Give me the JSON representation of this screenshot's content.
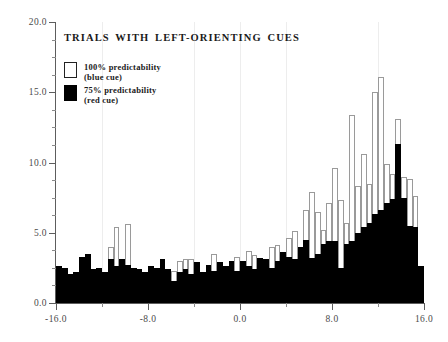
{
  "chart_data": {
    "type": "bar",
    "title": "TRIALS  WITH  LEFT-ORIENTING  CUES",
    "xlabel": "",
    "ylabel": "",
    "xlim": [
      -16.0,
      16.0
    ],
    "ylim": [
      0.0,
      20.0
    ],
    "grid": false,
    "bin_width": 0.5,
    "legend_position": "top-left",
    "x_ticks": [
      "-16.0",
      "-8.0",
      "0.0",
      "8.0",
      "16.0"
    ],
    "x_tick_values": [
      -16.0,
      -8.0,
      0.0,
      8.0,
      16.0
    ],
    "x_minor_tick_values": [
      -12.0,
      -4.0,
      4.0,
      12.0
    ],
    "y_ticks": [
      "0.0",
      "5.0",
      "10.0",
      "15.0",
      "20.0"
    ],
    "y_tick_values": [
      0.0,
      5.0,
      10.0,
      15.0,
      20.0
    ],
    "y_minor_tick_values": [
      1.25,
      2.5,
      3.75,
      6.25,
      7.5,
      8.75,
      11.25,
      12.5,
      13.75,
      16.25,
      17.5,
      18.75
    ],
    "bin_centers": [
      -15.75,
      -15.25,
      -14.75,
      -14.25,
      -13.75,
      -13.25,
      -12.75,
      -12.25,
      -11.75,
      -11.25,
      -10.75,
      -10.25,
      -9.75,
      -9.25,
      -8.75,
      -8.25,
      -7.75,
      -7.25,
      -6.75,
      -6.25,
      -5.75,
      -5.25,
      -4.75,
      -4.25,
      -3.75,
      -3.25,
      -2.75,
      -2.25,
      -1.75,
      -1.25,
      -0.75,
      -0.25,
      0.25,
      0.75,
      1.25,
      1.75,
      2.25,
      2.75,
      3.25,
      3.75,
      4.25,
      4.75,
      5.25,
      5.75,
      6.25,
      6.75,
      7.25,
      7.75,
      8.25,
      8.75,
      9.25,
      9.75,
      10.25,
      10.75,
      11.25,
      11.75,
      12.25,
      12.75,
      13.25,
      13.75,
      14.25,
      14.75,
      15.25,
      15.75
    ],
    "series": [
      {
        "name": "100% predictability (blue cue)",
        "style": "open-outline",
        "color": "#ffffff",
        "edge_color": "#9a9a9a",
        "values": [
          2.6,
          2.5,
          2.1,
          2.2,
          3.3,
          3.5,
          2.4,
          2.5,
          2.2,
          4.0,
          5.4,
          3.1,
          5.6,
          2.5,
          2.4,
          2.2,
          2.6,
          2.5,
          3.1,
          2.4,
          2.3,
          3.0,
          3.1,
          3.1,
          2.9,
          2.2,
          2.7,
          3.5,
          2.9,
          2.6,
          3.0,
          3.3,
          3.0,
          3.7,
          3.4,
          3.2,
          3.1,
          4.0,
          4.1,
          3.6,
          4.6,
          5.1,
          4.0,
          6.6,
          7.9,
          6.5,
          5.2,
          7.1,
          9.6,
          7.3,
          5.7,
          13.4,
          8.3,
          10.6,
          8.5,
          15.0,
          16.1,
          9.9,
          9.2,
          13.1,
          9.0,
          8.8,
          7.6,
          2.6
        ]
      },
      {
        "name": "75% predictability (red cue)",
        "style": "solid-fill",
        "color": "#000000",
        "edge_color": "#000000",
        "values": [
          2.6,
          2.5,
          2.1,
          2.2,
          3.3,
          3.5,
          2.4,
          2.5,
          2.2,
          3.1,
          2.6,
          3.1,
          2.7,
          2.5,
          2.4,
          2.2,
          2.6,
          2.5,
          3.1,
          2.4,
          1.6,
          2.2,
          2.4,
          2.1,
          2.9,
          2.2,
          2.7,
          2.3,
          2.9,
          2.6,
          3.0,
          2.3,
          3.0,
          2.6,
          2.4,
          3.2,
          3.1,
          2.5,
          3.0,
          3.6,
          3.3,
          3.1,
          4.0,
          4.5,
          3.2,
          3.5,
          4.2,
          4.4,
          4.4,
          2.5,
          4.2,
          4.4,
          5.0,
          5.4,
          5.7,
          6.3,
          6.6,
          7.1,
          7.4,
          11.3,
          7.5,
          5.5,
          5.4,
          2.6
        ]
      }
    ]
  },
  "legend": {
    "items": [
      {
        "label": "100% predictability",
        "sublabel": "(blue  cue)",
        "swatch": "open"
      },
      {
        "label": "75% predictability",
        "sublabel": "(red  cue)",
        "swatch": "filled"
      }
    ]
  }
}
